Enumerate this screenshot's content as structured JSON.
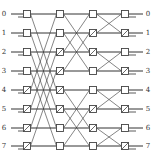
{
  "diagram": {
    "type": "multistage switching network (butterfly)",
    "stages": 4,
    "inputs": [
      "0",
      "1",
      "2",
      "3",
      "4",
      "5",
      "6",
      "7"
    ],
    "outputs": [
      "0",
      "1",
      "2",
      "3",
      "4",
      "5",
      "6",
      "7"
    ],
    "row_y": [
      14,
      33,
      52,
      71,
      90,
      109,
      128,
      146
    ],
    "stage_x": [
      27,
      60,
      93,
      125
    ],
    "switch_states": [
      [
        0,
        0,
        0,
        0,
        1,
        1,
        1,
        1
      ],
      [
        0,
        0,
        1,
        1,
        1,
        1,
        0,
        0
      ],
      [
        0,
        1,
        1,
        0,
        0,
        1,
        1,
        0
      ],
      [
        0,
        1,
        0,
        1,
        0,
        1,
        0,
        1
      ]
    ],
    "connections": [
      {
        "from_stage": 1,
        "to_stage": 2,
        "pairs": [
          [
            0,
            0
          ],
          [
            0,
            4
          ],
          [
            1,
            1
          ],
          [
            1,
            5
          ],
          [
            2,
            2
          ],
          [
            2,
            6
          ],
          [
            3,
            3
          ],
          [
            3,
            7
          ],
          [
            4,
            4
          ],
          [
            4,
            0
          ],
          [
            5,
            5
          ],
          [
            5,
            1
          ],
          [
            6,
            6
          ],
          [
            6,
            2
          ],
          [
            7,
            7
          ],
          [
            7,
            3
          ]
        ]
      },
      {
        "from_stage": 2,
        "to_stage": 3,
        "pairs": [
          [
            0,
            0
          ],
          [
            0,
            2
          ],
          [
            1,
            1
          ],
          [
            1,
            3
          ],
          [
            2,
            2
          ],
          [
            2,
            0
          ],
          [
            3,
            3
          ],
          [
            3,
            1
          ],
          [
            4,
            4
          ],
          [
            4,
            6
          ],
          [
            5,
            5
          ],
          [
            5,
            7
          ],
          [
            6,
            6
          ],
          [
            6,
            4
          ],
          [
            7,
            7
          ],
          [
            7,
            5
          ]
        ]
      },
      {
        "from_stage": 3,
        "to_stage": 4,
        "pairs": [
          [
            0,
            0
          ],
          [
            0,
            1
          ],
          [
            1,
            1
          ],
          [
            1,
            0
          ],
          [
            2,
            2
          ],
          [
            2,
            3
          ],
          [
            3,
            3
          ],
          [
            3,
            2
          ],
          [
            4,
            4
          ],
          [
            4,
            5
          ],
          [
            5,
            5
          ],
          [
            5,
            4
          ],
          [
            6,
            6
          ],
          [
            6,
            7
          ],
          [
            7,
            7
          ],
          [
            7,
            6
          ]
        ]
      }
    ],
    "colors": {
      "line": "#333333",
      "box": "#444444",
      "background": "#ffffff"
    }
  }
}
